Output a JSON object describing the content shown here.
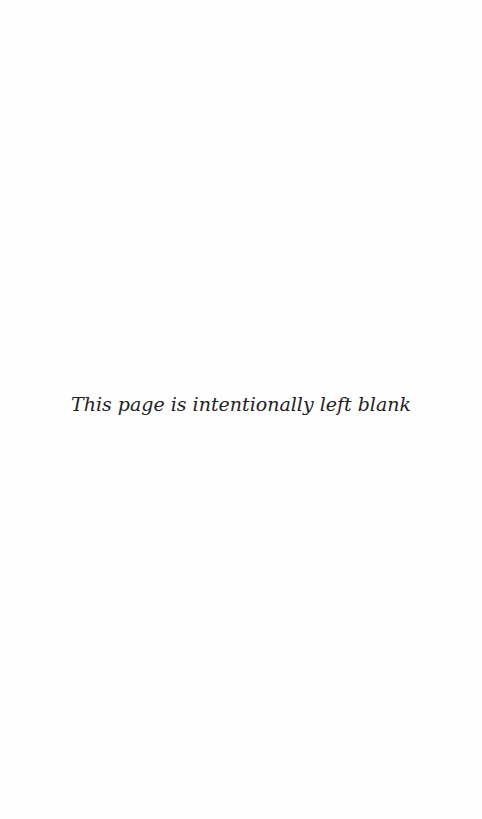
{
  "page": {
    "notice": "This page is intentionally left blank",
    "background_color": "#fefefe",
    "text_color": "#222222"
  }
}
